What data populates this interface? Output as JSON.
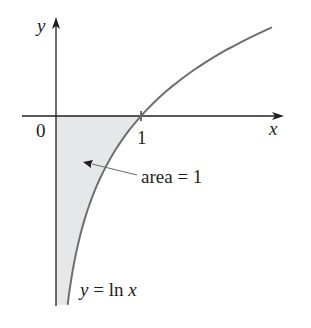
{
  "diagram": {
    "axes": {
      "x_label": "x",
      "y_label": "y",
      "origin_label": "0",
      "tick_label": "1"
    },
    "curve": {
      "label_prefix": "y = ",
      "label_fn": "ln",
      "label_var": "x",
      "equation": "y = ln x",
      "x_range": [
        0.137,
        2.54
      ]
    },
    "annotation": {
      "text": "area = 1"
    },
    "colors": {
      "axis": "#231f20",
      "curve": "#6d6e71",
      "shade": "#e6e7e8",
      "text": "#231f20"
    }
  }
}
